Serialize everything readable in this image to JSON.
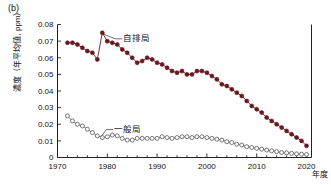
{
  "panel": {
    "label": "(b)"
  },
  "axes": {
    "ylabel": "濃度（年平均値, ppm）",
    "xlabel_unit": "年度",
    "yticks": [
      "0",
      "0.01",
      "0.02",
      "0.03",
      "0.04",
      "0.05",
      "0.06",
      "0.07",
      "0.08"
    ],
    "xticks": [
      "1970",
      "1980",
      "1990",
      "2000",
      "2010",
      "2020"
    ]
  },
  "legend": {
    "roadside": "自排局",
    "general": "一般局"
  },
  "colors": {
    "roadside": "#5c1118",
    "roadside_fill": "#6b1a20",
    "general_stroke": "#555555",
    "axis": "#222222"
  },
  "chart_data": {
    "type": "line",
    "title": "(b)",
    "xlabel": "年度",
    "ylabel": "濃度（年平均値, ppm）",
    "xlim": [
      1970,
      2021
    ],
    "ylim": [
      0,
      0.08
    ],
    "grid": false,
    "legend_position": "inline-annotation",
    "x": [
      1972,
      1973,
      1974,
      1975,
      1976,
      1977,
      1978,
      1979,
      1980,
      1981,
      1982,
      1983,
      1984,
      1985,
      1986,
      1987,
      1988,
      1989,
      1990,
      1991,
      1992,
      1993,
      1994,
      1995,
      1996,
      1997,
      1998,
      1999,
      2000,
      2001,
      2002,
      2003,
      2004,
      2005,
      2006,
      2007,
      2008,
      2009,
      2010,
      2011,
      2012,
      2013,
      2014,
      2015,
      2016,
      2017,
      2018,
      2019,
      2020
    ],
    "series": [
      {
        "name": "自排局",
        "marker": "filled-circle",
        "color": "#5c1118",
        "values": [
          0.069,
          0.069,
          0.068,
          0.066,
          0.064,
          0.063,
          0.059,
          0.075,
          0.07,
          0.069,
          0.068,
          0.065,
          0.063,
          0.06,
          0.057,
          0.058,
          0.06,
          0.059,
          0.057,
          0.056,
          0.054,
          0.052,
          0.051,
          0.052,
          0.05,
          0.05,
          0.052,
          0.052,
          0.051,
          0.049,
          0.047,
          0.044,
          0.043,
          0.041,
          0.039,
          0.037,
          0.034,
          0.031,
          0.029,
          0.027,
          0.024,
          0.022,
          0.02,
          0.018,
          0.016,
          0.014,
          0.012,
          0.01,
          0.007
        ]
      },
      {
        "name": "一般局",
        "marker": "open-circle",
        "color": "#555555",
        "values": [
          0.025,
          0.022,
          0.02,
          0.019,
          0.017,
          0.015,
          0.013,
          0.012,
          0.0125,
          0.0135,
          0.013,
          0.0115,
          0.0105,
          0.0105,
          0.0115,
          0.0115,
          0.0115,
          0.0115,
          0.0115,
          0.0125,
          0.012,
          0.0115,
          0.012,
          0.0125,
          0.0125,
          0.012,
          0.0125,
          0.0125,
          0.012,
          0.0115,
          0.011,
          0.0105,
          0.0095,
          0.009,
          0.008,
          0.0075,
          0.0065,
          0.006,
          0.0055,
          0.005,
          0.0045,
          0.004,
          0.0035,
          0.003,
          0.0028,
          0.0025,
          0.0022,
          0.002,
          0.0018
        ]
      }
    ]
  }
}
